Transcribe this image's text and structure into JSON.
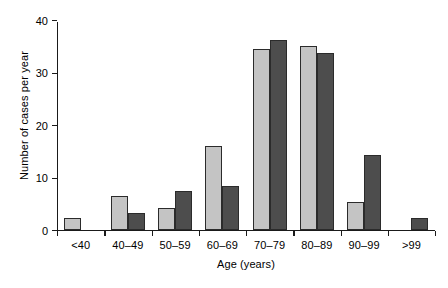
{
  "chart_data": {
    "type": "bar",
    "title": "",
    "xlabel": "Age (years)",
    "ylabel": "Number of cases per year",
    "categories": [
      "<40",
      "40–49",
      "50–59",
      "60–69",
      "70–79",
      "80–89",
      "90–99",
      ">99"
    ],
    "series": [
      {
        "name": "light-gray-series",
        "color": "#c4c4c4",
        "values": [
          2.2,
          6.4,
          4.2,
          16.0,
          34.5,
          35.0,
          5.3,
          0
        ]
      },
      {
        "name": "dark-gray-series",
        "color": "#4d4d4d",
        "values": [
          0,
          3.2,
          7.5,
          8.4,
          36.2,
          33.7,
          14.2,
          2.3
        ]
      }
    ],
    "ylim": [
      0,
      40
    ],
    "yticks": [
      0,
      10,
      20,
      30,
      40
    ],
    "ytick_labels": [
      "0",
      "10",
      "20",
      "30",
      "40"
    ],
    "grid": false,
    "legend": "none",
    "bar_outline_color": "#2b2b2b",
    "axis_color": "#1a1a1a"
  }
}
